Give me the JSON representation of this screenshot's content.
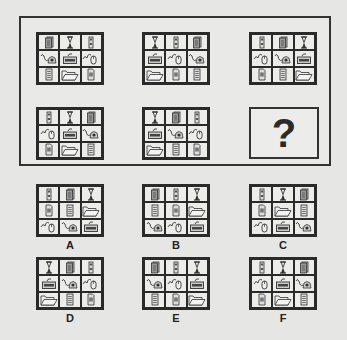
{
  "puzzle": {
    "icon_legend": {
      "papers": "stacked-papers-icon",
      "hourglass": "hourglass-icon",
      "tower": "computer-tower-icon",
      "phone": "telephone-icon",
      "keyboard": "keyboard-icon",
      "mouse": "mouse-icon",
      "lines": "lined-document-icon",
      "folder": "folder-icon",
      "page": "page-document-icon"
    },
    "question_mark": "?",
    "matrix": [
      {
        "id": "m1",
        "cells": [
          "papers",
          "hourglass",
          "tower",
          "phone",
          "keyboard",
          "mouse",
          "lines",
          "folder",
          "page"
        ]
      },
      {
        "id": "m2",
        "cells": [
          "hourglass",
          "tower",
          "papers",
          "keyboard",
          "mouse",
          "phone",
          "folder",
          "page",
          "lines"
        ]
      },
      {
        "id": "m3",
        "cells": [
          "tower",
          "papers",
          "hourglass",
          "mouse",
          "phone",
          "keyboard",
          "page",
          "lines",
          "folder"
        ]
      },
      {
        "id": "m4",
        "cells": [
          "tower",
          "hourglass",
          "papers",
          "mouse",
          "keyboard",
          "phone",
          "page",
          "folder",
          "lines"
        ]
      },
      {
        "id": "m5",
        "cells": [
          "hourglass",
          "papers",
          "tower",
          "keyboard",
          "phone",
          "mouse",
          "folder",
          "lines",
          "page"
        ]
      }
    ],
    "options": [
      {
        "label": "A",
        "cells": [
          "tower",
          "papers",
          "hourglass",
          "page",
          "lines",
          "folder",
          "mouse",
          "phone",
          "keyboard"
        ]
      },
      {
        "label": "B",
        "cells": [
          "papers",
          "tower",
          "hourglass",
          "lines",
          "page",
          "folder",
          "phone",
          "mouse",
          "keyboard"
        ]
      },
      {
        "label": "C",
        "cells": [
          "tower",
          "hourglass",
          "papers",
          "page",
          "folder",
          "lines",
          "mouse",
          "keyboard",
          "phone"
        ]
      },
      {
        "label": "D",
        "cells": [
          "hourglass",
          "papers",
          "tower",
          "keyboard",
          "phone",
          "mouse",
          "folder",
          "lines",
          "page"
        ]
      },
      {
        "label": "E",
        "cells": [
          "papers",
          "tower",
          "hourglass",
          "phone",
          "mouse",
          "keyboard",
          "lines",
          "page",
          "folder"
        ]
      },
      {
        "label": "F",
        "cells": [
          "tower",
          "hourglass",
          "papers",
          "mouse",
          "keyboard",
          "phone",
          "page",
          "folder",
          "lines"
        ]
      }
    ]
  },
  "colors": {
    "line": "#2a2a2a",
    "background": "#e6e6e4"
  }
}
